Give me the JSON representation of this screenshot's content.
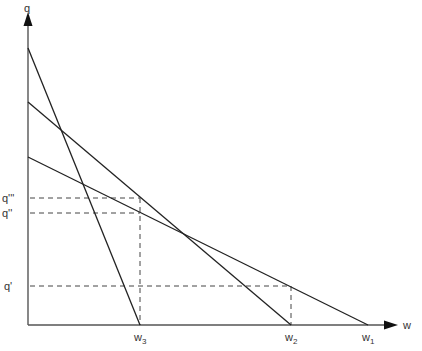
{
  "diagram": {
    "type": "line",
    "axes": {
      "y_label": "q",
      "x_label": "w"
    },
    "lines": [
      {
        "name": "line-w3",
        "y_intercept_px": [
          28,
          48
        ],
        "x_intercept_px": [
          140,
          325
        ],
        "x_label": "w",
        "x_sub": "3"
      },
      {
        "name": "line-w2",
        "y_intercept_px": [
          28,
          102
        ],
        "x_intercept_px": [
          291,
          325
        ],
        "x_label": "w",
        "x_sub": "2"
      },
      {
        "name": "line-w1",
        "y_intercept_px": [
          28,
          157
        ],
        "x_intercept_px": [
          368,
          325
        ],
        "x_label": "w",
        "x_sub": "1"
      }
    ],
    "y_ticks": [
      {
        "label": "q'''",
        "y": 198
      },
      {
        "label": "q''",
        "y": 213
      },
      {
        "label": "q'",
        "y": 286
      }
    ],
    "guides": [
      {
        "from": [
          28,
          198
        ],
        "to": [
          140,
          198
        ]
      },
      {
        "from": [
          28,
          213
        ],
        "to": [
          140,
          213
        ]
      },
      {
        "from": [
          28,
          286
        ],
        "to": [
          291,
          286
        ]
      },
      {
        "from": [
          140,
          198
        ],
        "to": [
          140,
          325
        ]
      },
      {
        "from": [
          291,
          286
        ],
        "to": [
          291,
          325
        ]
      }
    ],
    "labels": {
      "q": "q",
      "w": "w",
      "w1": "w",
      "w1_sub": "1",
      "w2": "w",
      "w2_sub": "2",
      "w3": "w",
      "w3_sub": "3",
      "q1": "q'",
      "q2": "q''",
      "q3": "q'''"
    }
  }
}
